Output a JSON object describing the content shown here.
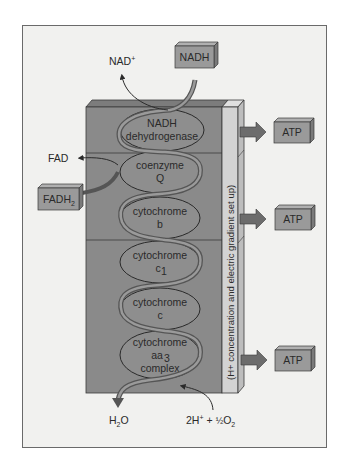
{
  "diagram": {
    "colors": {
      "block_front": "#8a8a8a",
      "block_top": "#7a7a7a",
      "ellipse_fill": "#8e8e8e",
      "gradient_bar": "#cfcfcf",
      "box_fill": "#9a9a9a",
      "arrow": "#6c6c6c",
      "frame_bg": "#f1f1ef"
    },
    "inputs": {
      "nadh_box": "NADH",
      "nad_plus": "NAD",
      "nad_plus_sup": "+",
      "fad": "FAD",
      "fadh2_box": "FADH",
      "fadh2_sub": "2",
      "h2o_main": "H",
      "h2o_sub": "2",
      "h2o_end": "O",
      "oxygen_prefix": "2H",
      "oxygen_sup": "+",
      "oxygen_plus": "+",
      "oxygen_half": "½",
      "oxygen_o": "O",
      "oxygen_sub": "2"
    },
    "complexes": [
      {
        "line1": "NADH",
        "line2": "dehydrogenase"
      },
      {
        "line1": "coenzyme",
        "line2": "Q"
      },
      {
        "line1": "cytochrome",
        "line2": "b"
      },
      {
        "line1": "cytochrome",
        "line2": "c",
        "line2_sub": "1"
      },
      {
        "line1": "cytochrome",
        "line2": "c"
      },
      {
        "line1": "cytochrome",
        "line2": "aa",
        "line2_sub": "3",
        "line3": "complex"
      }
    ],
    "gradient_label": "(H+ concentration and electric gradient set up)",
    "atp_boxes": [
      "ATP",
      "ATP",
      "ATP"
    ]
  }
}
